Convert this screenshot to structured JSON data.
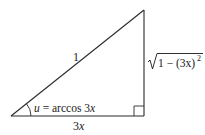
{
  "diagram": {
    "type": "right-triangle",
    "colors": {
      "stroke": "#2a2a2a",
      "text": "#1a1a1a",
      "background": "#ffffff"
    },
    "vertices": {
      "angle_vertex": [
        11,
        116
      ],
      "right_angle_vertex": [
        145,
        116
      ],
      "top_vertex": [
        145,
        10
      ]
    },
    "labels": {
      "hypotenuse": "1",
      "adjacent": "3x",
      "opposite_radicand": "1 − (3x)",
      "opposite_exponent": "2",
      "angle_var": "u",
      "angle_eq": " = arccos 3",
      "angle_x": "x"
    },
    "right_angle_marker": true
  }
}
